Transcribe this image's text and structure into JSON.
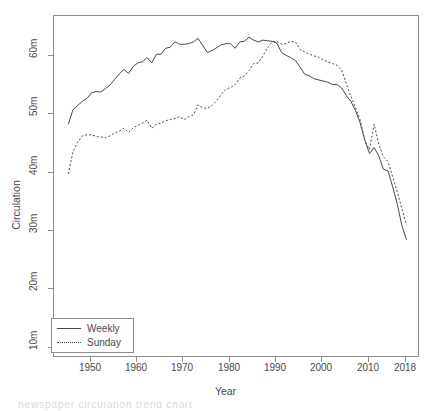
{
  "chart_data": {
    "type": "line",
    "title": "",
    "xlabel": "Year",
    "ylabel": "Circulation",
    "xlim": [
      1945,
      2018
    ],
    "ylim": [
      8000000,
      65000000
    ],
    "grid": false,
    "legend_position": "bottom-left",
    "y_tick_labels": [
      "10m",
      "20m",
      "30m",
      "40m",
      "50m",
      "60m"
    ],
    "y_tick_values": [
      10000000,
      20000000,
      30000000,
      40000000,
      50000000,
      60000000
    ],
    "x_tick_labels": [
      "1950",
      "1960",
      "1970",
      "1980",
      "1990",
      "2000",
      "2010",
      "2018"
    ],
    "x_tick_values": [
      1950,
      1960,
      1970,
      1980,
      1990,
      2000,
      2010,
      2018
    ],
    "y_unit_note": "m = millions of copies",
    "series": [
      {
        "name": "Weekly",
        "style": "solid",
        "color": "#4a4a4a",
        "x": [
          1945,
          1946,
          1947,
          1948,
          1949,
          1950,
          1951,
          1952,
          1953,
          1954,
          1955,
          1956,
          1957,
          1958,
          1959,
          1960,
          1961,
          1962,
          1963,
          1964,
          1965,
          1966,
          1967,
          1968,
          1969,
          1970,
          1971,
          1972,
          1973,
          1974,
          1975,
          1976,
          1977,
          1978,
          1979,
          1980,
          1981,
          1982,
          1983,
          1984,
          1985,
          1986,
          1987,
          1988,
          1989,
          1990,
          1991,
          1992,
          1993,
          1994,
          1995,
          1996,
          1997,
          1998,
          1999,
          2000,
          2001,
          2002,
          2003,
          2004,
          2005,
          2006,
          2007,
          2008,
          2009,
          2010,
          2011,
          2012,
          2013,
          2014,
          2015,
          2016,
          2017,
          2018
        ],
        "values": [
          48.4,
          50.9,
          51.6,
          52.3,
          52.8,
          53.8,
          54.0,
          53.9,
          54.5,
          55.1,
          56.1,
          57.0,
          57.8,
          57.1,
          58.3,
          58.9,
          59.1,
          59.8,
          58.9,
          60.4,
          60.4,
          61.4,
          61.6,
          62.5,
          62.1,
          62.1,
          62.2,
          62.5,
          63.1,
          61.9,
          60.7,
          61.0,
          61.5,
          62.0,
          62.2,
          62.2,
          61.4,
          62.5,
          62.6,
          63.3,
          62.8,
          62.5,
          62.8,
          62.7,
          62.6,
          62.3,
          60.7,
          60.2,
          59.8,
          59.3,
          58.2,
          57.0,
          56.7,
          56.2,
          56.0,
          55.8,
          55.6,
          55.2,
          55.2,
          54.6,
          53.3,
          52.3,
          50.7,
          48.6,
          45.6,
          43.4,
          44.4,
          43.0,
          40.7,
          40.4,
          37.7,
          34.7,
          31.0,
          28.6
        ]
      },
      {
        "name": "Sunday",
        "style": "dotted",
        "color": "#4a4a4a",
        "x": [
          1945,
          1946,
          1947,
          1948,
          1949,
          1950,
          1951,
          1952,
          1953,
          1954,
          1955,
          1956,
          1957,
          1958,
          1959,
          1960,
          1961,
          1962,
          1963,
          1964,
          1965,
          1966,
          1967,
          1968,
          1969,
          1970,
          1971,
          1972,
          1973,
          1974,
          1975,
          1976,
          1977,
          1978,
          1979,
          1980,
          1981,
          1982,
          1983,
          1984,
          1985,
          1986,
          1987,
          1988,
          1989,
          1990,
          1991,
          1992,
          1993,
          1994,
          1995,
          1996,
          1997,
          1998,
          1999,
          2000,
          2001,
          2002,
          2003,
          2004,
          2005,
          2006,
          2007,
          2008,
          2009,
          2010,
          2011,
          2012,
          2013,
          2014,
          2015,
          2016,
          2017,
          2018
        ],
        "values": [
          39.9,
          43.7,
          45.3,
          46.4,
          46.6,
          46.6,
          46.3,
          46.2,
          46.1,
          46.4,
          46.9,
          47.2,
          47.7,
          47.0,
          47.8,
          48.2,
          48.6,
          49.1,
          47.7,
          48.4,
          48.6,
          49.0,
          49.2,
          49.4,
          49.7,
          49.2,
          49.7,
          50.0,
          51.7,
          51.2,
          51.1,
          51.6,
          52.4,
          53.5,
          54.4,
          54.7,
          55.2,
          56.3,
          56.7,
          57.6,
          58.8,
          58.9,
          60.1,
          61.5,
          62.5,
          62.6,
          62.1,
          62.2,
          62.6,
          62.5,
          61.2,
          60.8,
          60.4,
          60.1,
          59.9,
          59.4,
          59.1,
          58.8,
          58.5,
          57.7,
          55.3,
          53.2,
          51.2,
          49.1,
          45.6,
          44.1,
          48.4,
          45.0,
          42.8,
          42.0,
          39.4,
          36.8,
          33.9,
          31.1
        ]
      }
    ],
    "annotations": {
      "weekly_peak": {
        "year": 1984,
        "value": 63.3
      },
      "sunday_peak": {
        "year": 1993,
        "value": 62.6
      },
      "crossover_year": 1989
    }
  },
  "axes": {
    "y_label": "Circulation",
    "x_label": "Year"
  },
  "legend": {
    "entries": [
      {
        "label": "Weekly",
        "key": "solid-line-key"
      },
      {
        "label": "Sunday",
        "key": "dotted-line-key"
      }
    ]
  },
  "caption": {
    "text": "newspaper  circulation  trend  chart"
  }
}
